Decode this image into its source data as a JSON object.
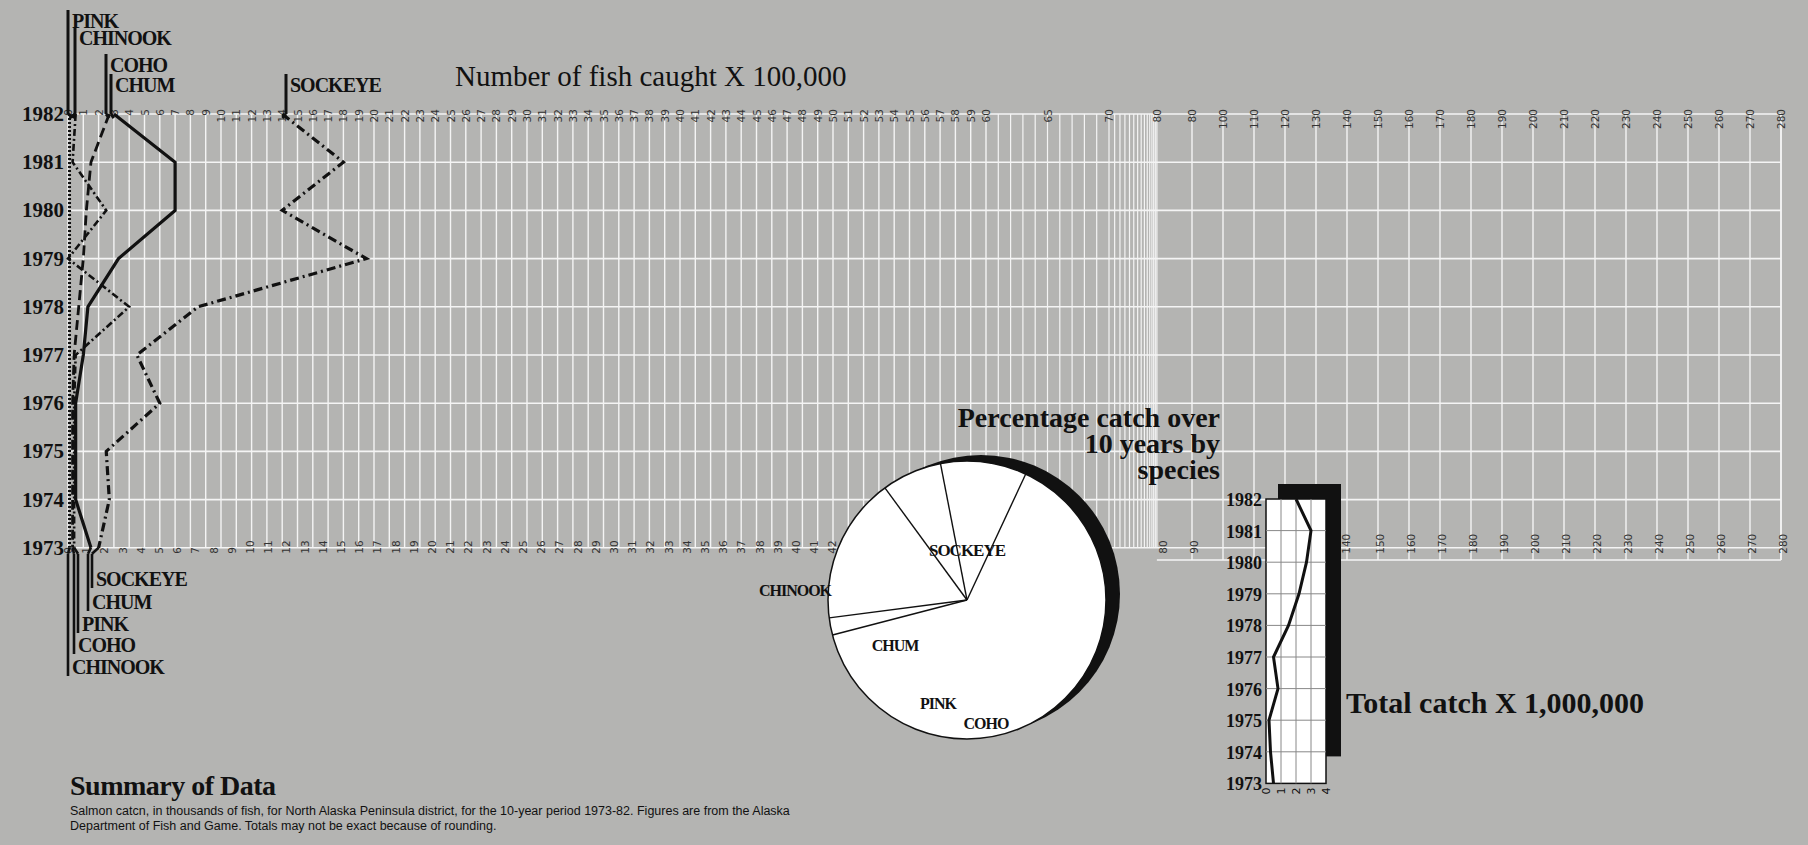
{
  "titles": {
    "main": "Number of fish caught X 100,000",
    "pie": [
      "Percentage catch over",
      "10 years by",
      "species"
    ],
    "total": "Total catch X 1,000,000"
  },
  "summary": {
    "heading": "Summary of Data",
    "body": "Salmon catcn, in thousands of fish, for North Alaska Peninsula district, for the 10-year period 1973-82. Figures are from the Alaska Department of Fish and Game. Totals may not be exact because of rounding."
  },
  "colors": {
    "background": "#b4b4b2",
    "grid": "#f4f4f4",
    "ink": "#111111",
    "pie_fill": "#ffffff"
  },
  "chart_data": [
    {
      "type": "line",
      "title": "Number of fish caught X 100,000",
      "orientation": "years on vertical axis, catch on horizontal axis",
      "y": [
        1982,
        1981,
        1980,
        1979,
        1978,
        1977,
        1976,
        1975,
        1974,
        1973
      ],
      "xlabel": "Number of fish caught X 100,000",
      "x_ticks_top": [
        "0",
        "1",
        "2",
        "3",
        "4",
        "5",
        "6",
        "7",
        "8",
        "9",
        "10",
        "11",
        "12",
        "13",
        "14",
        "15",
        "16",
        "17",
        "18",
        "19",
        "20",
        "21",
        "22",
        "23",
        "24",
        "25",
        "26",
        "27",
        "28",
        "29",
        "30",
        "31",
        "32",
        "33",
        "34",
        "35",
        "36",
        "37",
        "38",
        "39",
        "40",
        "41",
        "42",
        "43",
        "44",
        "45",
        "46",
        "47",
        "48",
        "49",
        "50",
        "51",
        "52",
        "53",
        "54",
        "55",
        "56",
        "57",
        "58",
        "59",
        "60",
        "65",
        "70",
        "80",
        "80",
        "100",
        "110",
        "120",
        "130",
        "140",
        "150",
        "160",
        "170",
        "180",
        "190",
        "200",
        "210",
        "220",
        "230",
        "240",
        "250",
        "260",
        "270",
        "280"
      ],
      "x_ticks_bottom": [
        "0",
        "1",
        "2",
        "3",
        "4",
        "5",
        "6",
        "7",
        "8",
        "9",
        "10",
        "11",
        "12",
        "13",
        "14",
        "15",
        "16",
        "17",
        "18",
        "19",
        "20",
        "21",
        "22",
        "23",
        "24",
        "25",
        "26",
        "27",
        "28",
        "29",
        "30",
        "31",
        "32",
        "33",
        "34",
        "35",
        "36",
        "37",
        "38",
        "39",
        "40",
        "41",
        "42",
        "43",
        "44",
        "45",
        "46",
        "47",
        "48",
        "49",
        "80",
        "90",
        "140",
        "150",
        "160",
        "170",
        "180",
        "190",
        "200",
        "210",
        "220",
        "230",
        "240",
        "250",
        "260",
        "270",
        "280"
      ],
      "top_labels": [
        "PINK",
        "CHINOOK",
        "COHO",
        "CHUM",
        "SOCKEYE"
      ],
      "bottom_labels": [
        "SOCKEYE",
        "CHUM",
        "PINK",
        "COHO",
        "CHINOOK"
      ],
      "series": [
        {
          "name": "SOCKEYE",
          "style": "dash-dot",
          "values": [
            14,
            18,
            14,
            19.5,
            8.5,
            4.5,
            6,
            2.5,
            2.7,
            2
          ]
        },
        {
          "name": "CHUM",
          "style": "solid",
          "values": [
            3,
            7,
            7,
            3.3,
            1.3,
            1,
            0.5,
            0.5,
            0.5,
            1.5
          ]
        },
        {
          "name": "COHO",
          "style": "dashed",
          "values": [
            2.7,
            1.5,
            1.2,
            1,
            0.7,
            0.4,
            0.3,
            0.3,
            0.3,
            0.3
          ]
        },
        {
          "name": "PINK",
          "style": "dash-dot-thin",
          "values": [
            0.5,
            0.3,
            2.5,
            0,
            4,
            0.5,
            0.4,
            0.4,
            0.4,
            0.4
          ]
        },
        {
          "name": "CHINOOK",
          "style": "dotted",
          "values": [
            0.1,
            0.1,
            0.1,
            0.1,
            0.1,
            0.1,
            0.1,
            0.1,
            0.1,
            0.1
          ]
        }
      ]
    },
    {
      "type": "pie",
      "title": "Percentage catch over 10 years by species",
      "categories": [
        "SOCKEYE",
        "CHINOOK",
        "CHUM",
        "PINK",
        "COHO"
      ],
      "values": [
        64,
        2,
        17,
        7,
        10
      ]
    },
    {
      "type": "line",
      "title": "Total catch X 1,000,000",
      "y": [
        1982,
        1981,
        1980,
        1979,
        1978,
        1977,
        1976,
        1975,
        1974,
        1973
      ],
      "x_ticks": [
        "0",
        "1",
        "2",
        "3",
        "4"
      ],
      "xlim": [
        0,
        4
      ],
      "values": [
        2,
        3,
        2.7,
        2.2,
        1.5,
        0.5,
        0.8,
        0.2,
        0.3,
        0.5
      ]
    }
  ]
}
